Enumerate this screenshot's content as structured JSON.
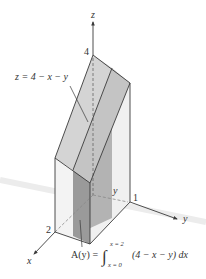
{
  "figure": {
    "type": "3D solid under plane",
    "axes": {
      "x_label": "x",
      "y_label": "y",
      "z_label": "z",
      "x_tick": "2",
      "y_tick": "1",
      "z_tick": "4"
    },
    "surface_label": "z = 4 − x − y",
    "slice_label": "y",
    "area_formula": {
      "lhs": "A(y) =",
      "upper_limit": "x = 2",
      "lower_limit": "x = 0",
      "integrand": "(4 − x − y) dx"
    },
    "colors": {
      "surface_fill": "#c8c8c8",
      "surface_fill_light": "#d6d6d6",
      "slice_fill": "#9e9e9e",
      "side_fill": "#e6e6e6",
      "line": "#3a3a3a"
    }
  }
}
